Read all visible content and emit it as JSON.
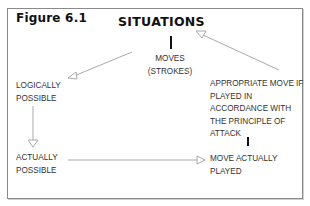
{
  "figure": {
    "label": "Figure 6.1",
    "title": "SITUATIONS"
  },
  "nodes": {
    "moves": {
      "lines": [
        "MOVES",
        "(STROKES)"
      ]
    },
    "logically_possible": {
      "lines": [
        "LOGICALLY",
        "POSSIBLE"
      ]
    },
    "actually_possible": {
      "lines": [
        "ACTUALLY",
        "POSSIBLE"
      ]
    },
    "appropriate_move": {
      "lines": [
        "APPROPRIATE MOVE IF",
        "PLAYED IN",
        "ACCORDANCE WITH",
        "THE PRINCIPLE OF",
        "ATTACK"
      ]
    },
    "move_actually_played": {
      "lines": [
        "MOVE ACTUALLY",
        "PLAYED"
      ]
    }
  },
  "edges": [
    {
      "from": "situations",
      "to": "moves",
      "style": "bar"
    },
    {
      "from": "moves",
      "to": "logically_possible",
      "style": "hollow-arrow"
    },
    {
      "from": "logically_possible",
      "to": "actually_possible",
      "style": "hollow-arrow"
    },
    {
      "from": "actually_possible",
      "to": "move_actually_played",
      "style": "hollow-arrow"
    },
    {
      "from": "appropriate_move",
      "to": "move_actually_played",
      "style": "bar"
    },
    {
      "from": "appropriate_move",
      "to": "situations",
      "style": "hollow-arrow"
    }
  ],
  "colors": {
    "border": "#8a8a8a",
    "arrow": "#9a9a9a",
    "text": "#333333",
    "title": "#111111"
  }
}
